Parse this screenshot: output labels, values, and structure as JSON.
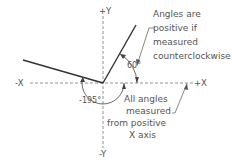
{
  "diagram": {
    "axes": {
      "pos_y": "+Y",
      "neg_y": "-Y",
      "neg_x": "-X",
      "pos_x": "+X"
    },
    "angles": {
      "positive": "60°",
      "negative": "-195°"
    },
    "notes": {
      "ccw_line1": "Angles are",
      "ccw_line2": "positive if",
      "ccw_line3": "measured",
      "ccw_line4": "counterclockwise",
      "ref_line1": "All angles",
      "ref_line2": "measured",
      "ref_line3": "from positive",
      "ref_line4": "X axis"
    },
    "colors": {
      "line": "#333333",
      "axis": "#777777",
      "text": "#555555"
    }
  }
}
